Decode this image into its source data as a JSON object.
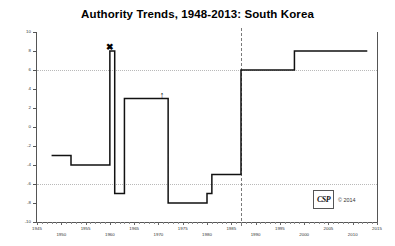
{
  "chart_data": {
    "type": "line",
    "title": "Authority Trends, 1948-2013: South Korea",
    "xlabel": "",
    "ylabel": "",
    "xlim": [
      1945,
      2015
    ],
    "ylim": [
      -10,
      10
    ],
    "grid": true,
    "gridlines_y": [
      6,
      -6
    ],
    "y_ticks": [
      10,
      8,
      6,
      4,
      2,
      0,
      -2,
      -4,
      -6,
      -8,
      -10
    ],
    "y_tick_labels": [
      "10",
      "8",
      "6",
      "4",
      "2",
      "0",
      "-2",
      "-4",
      "-6",
      "-8",
      "-10"
    ],
    "x_ticks": [
      1945,
      1950,
      1955,
      1960,
      1965,
      1970,
      1975,
      1980,
      1985,
      1990,
      1995,
      2000,
      2005,
      2010,
      2015
    ],
    "x_tick_labels": [
      "1945",
      "1950",
      "1955",
      "1960",
      "1965",
      "1970",
      "1975",
      "1980",
      "1985",
      "1990",
      "1995",
      "2000",
      "2005",
      "2010",
      "2015"
    ],
    "x_minor_tick_interval": 1,
    "series": [
      {
        "name": "Polity Score",
        "step": true,
        "x": [
          1948,
          1952,
          1960,
          1961,
          1961,
          1963,
          1972,
          1972,
          1980,
          1981,
          1987,
          1988,
          1998,
          2013
        ],
        "values": [
          -3,
          -4,
          8,
          8,
          -7,
          3,
          3,
          -8,
          -8,
          -5,
          -5,
          6,
          8,
          8
        ]
      }
    ],
    "step_points": [
      {
        "year": 1948,
        "value": -3
      },
      {
        "year": 1952,
        "value": -4
      },
      {
        "year": 1960,
        "value": 8
      },
      {
        "year": 1961,
        "value": -7
      },
      {
        "year": 1963,
        "value": 3
      },
      {
        "year": 1972,
        "value": -8
      },
      {
        "year": 1980,
        "value": -7
      },
      {
        "year": 1981,
        "value": -5
      },
      {
        "year": 1987,
        "value": 6
      },
      {
        "year": 1998,
        "value": 8
      },
      {
        "year": 2013,
        "value": 8
      }
    ],
    "annotations": [
      {
        "type": "era-divider",
        "label": "regime-change-divider",
        "year": 1987,
        "style": "dashed-vertical"
      },
      {
        "type": "marker",
        "label": "x-marker",
        "glyph": "✖",
        "year": 1960,
        "value": 8
      },
      {
        "type": "marker",
        "label": "up-arrow-marker",
        "glyph": "↑",
        "year": 1971,
        "value": 3
      }
    ],
    "colors": {
      "line": "#111111",
      "axis": "#555555",
      "grid": "#b9b9b9",
      "divider": "#7a7a7a",
      "background": "#ffffff"
    }
  },
  "footer": {
    "logo_text": "CSP",
    "copyright": "© 2014"
  }
}
